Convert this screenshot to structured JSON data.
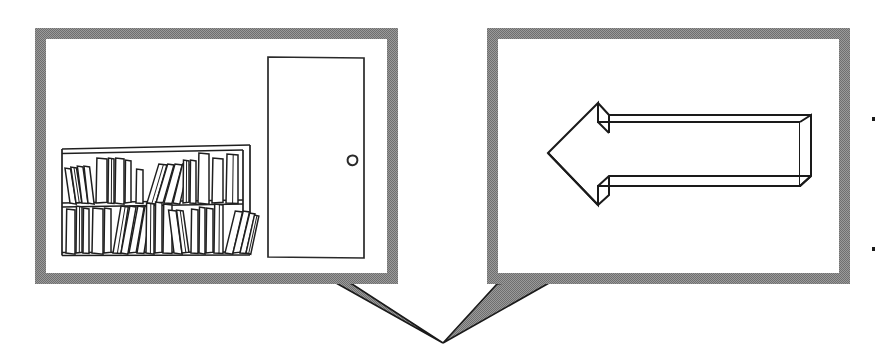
{
  "canvas": {
    "width": 878,
    "height": 346,
    "background": "#ffffff"
  },
  "palette": {
    "frame_gray": "#8a8a8a",
    "frame_gray_light": "#9a9a9a",
    "ink": "#1a1a1a",
    "paper": "#ffffff"
  },
  "illustration": {
    "title": "Two-panel comic: room with bookshelf and door, and a left-pointing 3D arrow",
    "style": "black-and-white line art with halftone gray panel frames",
    "panel_count": 2,
    "tail_convergence": {
      "x": 443,
      "y": 343,
      "note": "both speech-bubble tails point down toward a shared spot below and between the panels"
    }
  },
  "panels": [
    {
      "id": "panel-left",
      "name": "room-with-bookshelf-and-door",
      "caption": "",
      "frame": {
        "x": 35,
        "y": 28,
        "width": 363,
        "height": 256,
        "border_width": 11
      },
      "frame_color": "#8a8a8a",
      "interior_color": "#ffffff",
      "tail": {
        "direction": "down-right",
        "origin_x": 320,
        "origin_y": 284,
        "tip_x": 443,
        "tip_y": 343
      },
      "contents": [
        {
          "name": "door",
          "label": "door"
        },
        {
          "name": "door-knob",
          "label": "door knob"
        },
        {
          "name": "bookshelf",
          "label": "bookshelf",
          "shelf_count": 2
        },
        {
          "name": "books-upper-shelf",
          "label": "books on upper shelf",
          "count": 18
        },
        {
          "name": "books-lower-shelf",
          "label": "books on lower shelf",
          "count": 22
        }
      ]
    },
    {
      "id": "panel-right",
      "name": "left-pointing-arrow",
      "caption": "",
      "frame": {
        "x": 487,
        "y": 28,
        "width": 363,
        "height": 256,
        "border_width": 11
      },
      "frame_color": "#8a8a8a",
      "interior_color": "#ffffff",
      "tail": {
        "direction": "down-left",
        "origin_x": 565,
        "origin_y": 284,
        "tip_x": 443,
        "tip_y": 343
      },
      "contents": [
        {
          "name": "arrow-left-3d",
          "label": "three-dimensional arrow pointing left",
          "points": "left"
        }
      ]
    }
  ],
  "marks": [
    {
      "name": "edge-speck-top",
      "x": 873,
      "y": 118,
      "size": 3
    },
    {
      "name": "edge-speck-bottom",
      "x": 873,
      "y": 248,
      "size": 3
    }
  ],
  "geometry": {
    "door": {
      "left": 268,
      "right": 364,
      "top": 57,
      "bottom": 258,
      "knob_cx": 352,
      "knob_cy": 160,
      "knob_r": 5
    },
    "shelf_unit": {
      "left": 62,
      "right": 250,
      "top": 148,
      "bottom": 255,
      "top_rail_y": 152,
      "mid_shelf_y": 203,
      "right_post_x": 243,
      "floor_y": 253
    },
    "arrow": {
      "tip_x": 548,
      "tip_y": 153,
      "head_top_x": 598,
      "head_top_y": 103,
      "head_bottom_x": 598,
      "head_bottom_y": 205,
      "shaft_right_x": 800,
      "shaft_top_y": 122,
      "shaft_bottom_y": 186,
      "depth_dx": 11,
      "depth_dy": 12
    }
  },
  "books_upper": [
    {
      "x": 70,
      "w": 6,
      "h": 34,
      "tilt": -9
    },
    {
      "x": 76,
      "w": 6,
      "h": 35,
      "tilt": -9
    },
    {
      "x": 82,
      "w": 6,
      "h": 36,
      "tilt": -8
    },
    {
      "x": 88,
      "w": 6,
      "h": 36,
      "tilt": -7
    },
    {
      "x": 96,
      "w": 11,
      "h": 44,
      "tilt": 0
    },
    {
      "x": 108,
      "w": 6,
      "h": 44,
      "tilt": 0
    },
    {
      "x": 115,
      "w": 9,
      "h": 44,
      "tilt": 0
    },
    {
      "x": 125,
      "w": 6,
      "h": 42,
      "tilt": 0
    },
    {
      "x": 136,
      "w": 7,
      "h": 33,
      "tilt": 0
    },
    {
      "x": 147,
      "w": 9,
      "h": 38,
      "tilt": 16
    },
    {
      "x": 156,
      "w": 7,
      "h": 38,
      "tilt": 16
    },
    {
      "x": 164,
      "w": 8,
      "h": 38,
      "tilt": 15
    },
    {
      "x": 173,
      "w": 7,
      "h": 38,
      "tilt": 13
    },
    {
      "x": 183,
      "w": 6,
      "h": 42,
      "tilt": 0
    },
    {
      "x": 190,
      "w": 6,
      "h": 42,
      "tilt": 0
    },
    {
      "x": 198,
      "w": 11,
      "h": 49,
      "tilt": 0
    },
    {
      "x": 212,
      "w": 11,
      "h": 44,
      "tilt": 0
    },
    {
      "x": 226,
      "w": 12,
      "h": 48,
      "tilt": 0
    }
  ],
  "books_lower": [
    {
      "x": 66,
      "w": 9,
      "h": 43,
      "tilt": 0
    },
    {
      "x": 76,
      "w": 6,
      "h": 46,
      "tilt": 0
    },
    {
      "x": 83,
      "w": 6,
      "h": 44,
      "tilt": 0
    },
    {
      "x": 92,
      "w": 11,
      "h": 44,
      "tilt": 0
    },
    {
      "x": 104,
      "w": 7,
      "h": 44,
      "tilt": 0
    },
    {
      "x": 113,
      "w": 8,
      "h": 46,
      "tilt": 9
    },
    {
      "x": 121,
      "w": 7,
      "h": 46,
      "tilt": 10
    },
    {
      "x": 129,
      "w": 7,
      "h": 46,
      "tilt": 10
    },
    {
      "x": 137,
      "w": 7,
      "h": 46,
      "tilt": 9
    },
    {
      "x": 146,
      "w": 8,
      "h": 49,
      "tilt": 0
    },
    {
      "x": 155,
      "w": 7,
      "h": 50,
      "tilt": 0
    },
    {
      "x": 163,
      "w": 9,
      "h": 48,
      "tilt": 0
    },
    {
      "x": 174,
      "w": 8,
      "h": 42,
      "tilt": -8
    },
    {
      "x": 182,
      "w": 7,
      "h": 42,
      "tilt": -8
    },
    {
      "x": 191,
      "w": 7,
      "h": 43,
      "tilt": 0
    },
    {
      "x": 199,
      "w": 6,
      "h": 45,
      "tilt": 0
    },
    {
      "x": 206,
      "w": 7,
      "h": 44,
      "tilt": 0
    },
    {
      "x": 214,
      "w": 9,
      "h": 48,
      "tilt": 0
    },
    {
      "x": 225,
      "w": 8,
      "h": 41,
      "tilt": 13
    },
    {
      "x": 233,
      "w": 7,
      "h": 41,
      "tilt": 13
    },
    {
      "x": 240,
      "w": 6,
      "h": 39,
      "tilt": 13
    },
    {
      "x": 246,
      "w": 5,
      "h": 37,
      "tilt": 12
    }
  ]
}
